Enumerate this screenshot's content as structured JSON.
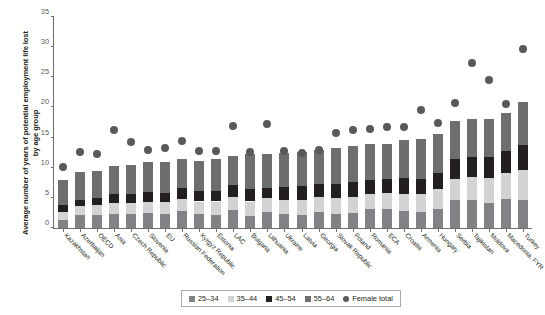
{
  "chart_data": {
    "type": "bar",
    "stacked": true,
    "title": "",
    "xlabel": "",
    "ylabel": "Average number of years of potential employment life lost by age group",
    "ylim": [
      0,
      35
    ],
    "yticks": [
      0,
      5,
      10,
      15,
      20,
      25,
      30,
      35
    ],
    "grid": false,
    "legend_position": "bottom",
    "categories": [
      "Kazakhstan",
      "Azerbaijan",
      "OECD",
      "Asia",
      "Czech Republic",
      "Slovenia",
      "EU",
      "Russian Federation",
      "Kyrgyz Republic",
      "Estonia",
      "LAC",
      "Bulgaria",
      "Lithuania",
      "Ukraine",
      "Latvia",
      "Georgia",
      "Slovak Republic",
      "Poland",
      "Romania",
      "ECA",
      "Croatia",
      "Armenia",
      "Hungary",
      "Serbia",
      "Tajikistan",
      "Moldova",
      "Macedonia, FYR",
      "Turkey"
    ],
    "series": [
      {
        "name": "25–34",
        "color": "#808285",
        "values": [
          1.4,
          2.2,
          2.2,
          2.4,
          2.3,
          2.5,
          2.4,
          2.8,
          2.4,
          2.2,
          3.0,
          2.0,
          2.7,
          2.4,
          2.1,
          2.7,
          2.3,
          2.5,
          3.1,
          3.2,
          2.8,
          2.6,
          3.2,
          4.6,
          4.6,
          4.2,
          4.8,
          4.7
        ]
      },
      {
        "name": "35–44",
        "color": "#d1d3d4",
        "values": [
          1.3,
          1.4,
          1.6,
          1.7,
          1.9,
          1.8,
          1.9,
          2.0,
          2.0,
          2.2,
          2.2,
          2.4,
          2.2,
          2.3,
          2.5,
          2.5,
          2.7,
          2.7,
          2.6,
          2.6,
          2.9,
          3.0,
          3.2,
          3.6,
          3.8,
          4.1,
          4.4,
          5.0
        ]
      },
      {
        "name": "45–54",
        "color": "#231f20",
        "values": [
          1.1,
          1.1,
          1.2,
          1.5,
          1.4,
          1.6,
          1.5,
          1.9,
          1.7,
          1.8,
          1.9,
          2.0,
          1.8,
          2.1,
          2.3,
          2.1,
          2.3,
          2.4,
          2.2,
          2.3,
          2.6,
          2.6,
          2.8,
          3.2,
          3.3,
          3.4,
          3.6,
          4.0
        ]
      },
      {
        "name": "55–64",
        "color": "#6d6e70",
        "values": [
          4.2,
          4.6,
          4.5,
          4.7,
          4.8,
          5.0,
          5.1,
          4.7,
          5.1,
          5.3,
          4.9,
          5.9,
          5.6,
          5.7,
          5.7,
          5.7,
          6.0,
          6.0,
          6.0,
          5.9,
          6.3,
          6.6,
          6.4,
          6.3,
          6.4,
          6.4,
          6.3,
          7.2
        ]
      }
    ],
    "overlay_series": {
      "name": "Female total",
      "marker": "circle",
      "color": "#58595b",
      "values": [
        10.2,
        12.6,
        12.3,
        16.3,
        14.3,
        12.9,
        13.2,
        14.4,
        12.7,
        12.8,
        16.9,
        12.6,
        17.2,
        12.8,
        12.5,
        13.0,
        15.7,
        16.3,
        16.4,
        16.8,
        16.7,
        19.6,
        17.5,
        20.8,
        27.4,
        24.5,
        20.6,
        29.7
      ]
    }
  },
  "legend": {
    "items": [
      {
        "label": "25–34",
        "color": "#808285",
        "marker": "square"
      },
      {
        "label": "35–44",
        "color": "#d1d3d4",
        "marker": "square"
      },
      {
        "label": "45–54",
        "color": "#231f20",
        "marker": "square"
      },
      {
        "label": "55–64",
        "color": "#6d6e70",
        "marker": "square"
      },
      {
        "label": "Female total",
        "color": "#58595b",
        "marker": "circle"
      }
    ]
  }
}
